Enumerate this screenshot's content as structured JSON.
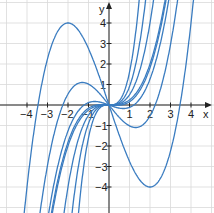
{
  "chart_data": {
    "type": "line",
    "title": "",
    "xlabel": "x",
    "ylabel": "y",
    "xlim": [
      -5,
      5
    ],
    "ylim": [
      -5,
      5
    ],
    "grid": true,
    "x_ticks": [
      "-4",
      "-3",
      "-2",
      "-1",
      "1",
      "2",
      "3",
      "4"
    ],
    "y_ticks": [
      "4",
      "3",
      "2",
      "1",
      "-1",
      "-2",
      "-3",
      "-4"
    ],
    "series": [
      {
        "name": "curve-t2",
        "description": "cubic with max (-2,4), min (2,-4)",
        "t": 2.0
      },
      {
        "name": "curve-t1.3",
        "description": "cubic with max (-1.3,1.1), min (1.3,-1.1)",
        "t": 1.3
      },
      {
        "name": "curve-t0.7",
        "t": 0.7
      },
      {
        "name": "curve-t0.35",
        "t": 0.35
      },
      {
        "name": "curve-t0",
        "t": 0.0
      },
      {
        "name": "curve-steep1",
        "k": 0.5
      },
      {
        "name": "curve-steep2",
        "k": 0.9
      },
      {
        "name": "curve-steep3",
        "k": 1.6
      }
    ],
    "line_color": "#3a7cc0"
  }
}
